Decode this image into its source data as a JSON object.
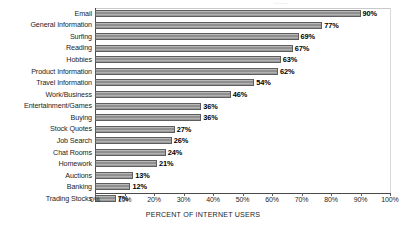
{
  "chart_data": {
    "type": "bar",
    "orientation": "horizontal",
    "title": "",
    "xlabel": "PERCENT OF INTERNET USERS",
    "ylabel": "",
    "xlim": [
      0,
      100
    ],
    "grid": false,
    "legend": "none",
    "tick_labels": [
      "0%",
      "10%",
      "20%",
      "30%",
      "40%",
      "50%",
      "60%",
      "70%",
      "80%",
      "90%",
      "100%"
    ],
    "tick_values": [
      0,
      10,
      20,
      30,
      40,
      50,
      60,
      70,
      80,
      90,
      100
    ],
    "categories": [
      "Email",
      "General Information",
      "Surfing",
      "Reading",
      "Hobbies",
      "Product Information",
      "Travel Information",
      "Work/Business",
      "Entertainment/Games",
      "Buying",
      "Stock Quotes",
      "Job Search",
      "Chat Rooms",
      "Homework",
      "Auctions",
      "Banking",
      "Trading Stocks"
    ],
    "values": [
      90,
      77,
      69,
      67,
      63,
      62,
      54,
      46,
      36,
      36,
      27,
      26,
      24,
      21,
      13,
      12,
      7
    ],
    "value_labels": [
      "90%",
      "77%",
      "69%",
      "67%",
      "63%",
      "62%",
      "54%",
      "46%",
      "36%",
      "36%",
      "27%",
      "26%",
      "24%",
      "21%",
      "13%",
      "12%",
      "7%"
    ],
    "bar_color": "#9a9a9a",
    "bar_edge_color": "#5e5e5e",
    "axis_color": "#4a4a4a"
  },
  "artifact": {
    "top_cut_text": "———"
  }
}
